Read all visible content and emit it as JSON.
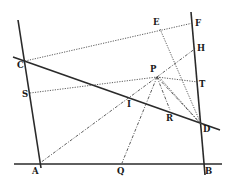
{
  "diagram": {
    "type": "geometric-construction",
    "points": [
      {
        "id": "A",
        "label": "A",
        "x": 40,
        "y": 163,
        "lx": 32,
        "ly": 174
      },
      {
        "id": "B",
        "label": "B",
        "x": 203,
        "y": 163,
        "lx": 205,
        "ly": 174
      },
      {
        "id": "C",
        "label": "C",
        "x": 25,
        "y": 61,
        "lx": 17,
        "ly": 68
      },
      {
        "id": "D",
        "label": "D",
        "x": 201,
        "y": 124,
        "lx": 203,
        "ly": 132
      },
      {
        "id": "E",
        "label": "E",
        "x": 160,
        "y": 29,
        "lx": 153,
        "ly": 25
      },
      {
        "id": "F",
        "label": "F",
        "x": 193,
        "y": 23,
        "lx": 195,
        "ly": 26
      },
      {
        "id": "H",
        "label": "H",
        "x": 196,
        "y": 48,
        "lx": 197,
        "ly": 51
      },
      {
        "id": "T",
        "label": "T",
        "x": 198,
        "y": 82,
        "lx": 199,
        "ly": 87
      },
      {
        "id": "P",
        "label": "P",
        "x": 157,
        "y": 77,
        "lx": 150,
        "ly": 72
      },
      {
        "id": "S",
        "label": "S",
        "x": 30,
        "y": 93,
        "lx": 22,
        "ly": 97
      },
      {
        "id": "I",
        "label": "I",
        "x": 128,
        "y": 97,
        "lx": 127,
        "ly": 107
      },
      {
        "id": "R",
        "label": "R",
        "x": 170,
        "y": 110,
        "lx": 166,
        "ly": 121
      },
      {
        "id": "Q",
        "label": "Q",
        "x": 122,
        "y": 163,
        "lx": 117,
        "ly": 174
      }
    ],
    "solid_lines": [
      {
        "name": "left-line-CA",
        "x1": 18,
        "y1": 20,
        "x2": 41,
        "y2": 168
      },
      {
        "name": "right-line-FB",
        "x1": 191,
        "y1": 12,
        "x2": 205,
        "y2": 175
      },
      {
        "name": "base-line-AB",
        "x1": 14,
        "y1": 164,
        "x2": 222,
        "y2": 164
      },
      {
        "name": "transversal-CD",
        "x1": 13,
        "y1": 57,
        "x2": 220,
        "y2": 130
      }
    ],
    "dotted_lines": [
      {
        "name": "line-CF",
        "x1": 25,
        "y1": 61,
        "x2": 193,
        "y2": 23,
        "style": "dotted"
      },
      {
        "name": "line-SP",
        "x1": 30,
        "y1": 93,
        "x2": 157,
        "y2": 77,
        "style": "dotted"
      },
      {
        "name": "line-PT",
        "x1": 157,
        "y1": 77,
        "x2": 198,
        "y2": 82,
        "style": "dotted"
      },
      {
        "name": "line-PH",
        "x1": 157,
        "y1": 77,
        "x2": 196,
        "y2": 48,
        "style": "dashdot"
      },
      {
        "name": "line-ED",
        "x1": 160,
        "y1": 29,
        "x2": 201,
        "y2": 124,
        "style": "dotted"
      },
      {
        "name": "line-PA",
        "x1": 157,
        "y1": 77,
        "x2": 40,
        "y2": 163,
        "style": "dashdot"
      },
      {
        "name": "line-PQ",
        "x1": 157,
        "y1": 77,
        "x2": 122,
        "y2": 163,
        "style": "dashdot"
      },
      {
        "name": "line-PR",
        "x1": 157,
        "y1": 77,
        "x2": 170,
        "y2": 110,
        "style": "dashdot"
      },
      {
        "name": "line-PD-1",
        "x1": 157,
        "y1": 77,
        "x2": 201,
        "y2": 124,
        "style": "dashdot"
      },
      {
        "name": "line-PD-2",
        "x1": 159,
        "y1": 77,
        "x2": 201,
        "y2": 124,
        "style": "dotted"
      }
    ],
    "colors": {
      "ink": "#2a2a2a",
      "background": "#ffffff"
    }
  }
}
